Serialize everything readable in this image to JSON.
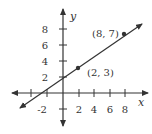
{
  "diagram": {
    "type": "coordinate-plane-line",
    "axes": {
      "x_label": "x",
      "y_label": "y",
      "x_ticks": [
        "-2",
        "2",
        "4",
        "6",
        "8"
      ],
      "y_ticks": [
        "2",
        "4",
        "6",
        "8"
      ]
    },
    "points": [
      {
        "label": "(2, 3)",
        "x": 2,
        "y": 3
      },
      {
        "label": "(8, 7)",
        "x": 8,
        "y": 7
      }
    ],
    "line": {
      "slope": "2/3",
      "through": [
        "(2, 3)",
        "(8, 7)"
      ]
    },
    "colors": {
      "ink": "#333333",
      "background": "#ffffff"
    }
  }
}
